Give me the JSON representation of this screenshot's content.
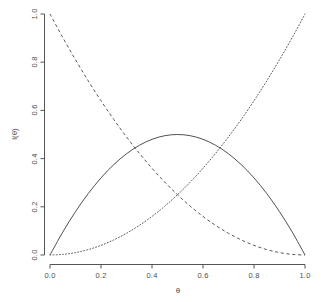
{
  "chart_data": {
    "type": "line",
    "title": "",
    "subtitle": "",
    "xlabel": "θ",
    "ylabel": "l(θ)",
    "xlim": [
      0.0,
      1.0
    ],
    "ylim": [
      0.0,
      1.0
    ],
    "grid": false,
    "legend": "none",
    "xticks": [
      "0.0",
      "0.2",
      "0.4",
      "0.6",
      "0.8",
      "1.0"
    ],
    "xtick_values": [
      0.0,
      0.2,
      0.4,
      0.6,
      0.8,
      1.0
    ],
    "yticks": [
      "0.0",
      "0.2",
      "0.4",
      "0.6",
      "0.8",
      "1.0"
    ],
    "ytick_values": [
      0.0,
      0.2,
      0.4,
      0.6,
      0.8,
      1.0
    ],
    "x": [
      0.0,
      0.05,
      0.1,
      0.15,
      0.2,
      0.25,
      0.3,
      0.35,
      0.4,
      0.45,
      0.5,
      0.55,
      0.6,
      0.65,
      0.7,
      0.75,
      0.8,
      0.85,
      0.9,
      0.95,
      1.0
    ],
    "series": [
      {
        "name": "l(θ) = 2θ(1−θ)",
        "style": "solid",
        "color": "#3c3c3c",
        "values": [
          0.0,
          0.095,
          0.18,
          0.255,
          0.32,
          0.375,
          0.42,
          0.455,
          0.48,
          0.495,
          0.5,
          0.495,
          0.48,
          0.455,
          0.42,
          0.375,
          0.32,
          0.255,
          0.18,
          0.095,
          0.0
        ]
      },
      {
        "name": "l(θ) = (1−θ)²",
        "style": "dashed",
        "color": "#3c3c3c",
        "values": [
          1.0,
          0.9025,
          0.81,
          0.7225,
          0.64,
          0.5625,
          0.49,
          0.4225,
          0.36,
          0.3025,
          0.25,
          0.2025,
          0.16,
          0.1225,
          0.09,
          0.0625,
          0.04,
          0.0225,
          0.01,
          0.0025,
          0.0
        ]
      },
      {
        "name": "l(θ) = θ²",
        "style": "dotted",
        "color": "#3c3c3c",
        "values": [
          0.0,
          0.0025,
          0.01,
          0.0225,
          0.04,
          0.0625,
          0.09,
          0.1225,
          0.16,
          0.2025,
          0.25,
          0.3025,
          0.36,
          0.4225,
          0.49,
          0.5625,
          0.64,
          0.7225,
          0.81,
          0.9025,
          1.0
        ]
      }
    ],
    "annotations": []
  },
  "axes": {
    "x_title": "θ",
    "y_title": "l(θ)"
  }
}
